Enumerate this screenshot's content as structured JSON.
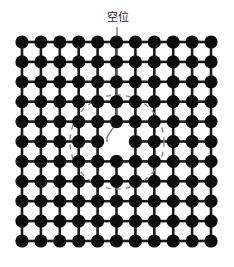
{
  "figure": {
    "caption_label": "空位",
    "background_color": "#ffffff",
    "atom_color": "#0d0d0d",
    "bond_color": "#1a1a1a",
    "annotation_color": "#7a7a7a",
    "dashed_circle_color": "#8a8a8a"
  },
  "chart_data": {
    "type": "scatter",
    "title": "",
    "subtitle": "",
    "xlabel": "",
    "ylabel": "",
    "lattice": {
      "rows": 11,
      "columns": 11,
      "origin_x": 22,
      "origin_y": 42,
      "spacing_x": 18.9,
      "spacing_y": 19.9,
      "atom_radius": 6.6,
      "bond_width": 2.6,
      "total_sites": 121,
      "occupied_sites": 120
    },
    "vacancy": {
      "label": "空位",
      "row_index": 5,
      "col_index": 5,
      "center_x": 117,
      "center_y": 142,
      "present": false
    },
    "annotations": [
      {
        "name": "leader-line",
        "type": "polyline",
        "points": "117,27 117,122 107,137 107,142",
        "color": "#7a7a7a",
        "width": 1.4
      },
      {
        "name": "strain-field-circle",
        "type": "dashed-circle",
        "center_x": 117,
        "center_y": 142,
        "radius": 47,
        "color": "#8a8a8a",
        "width": 1.4,
        "dash": "5 5"
      }
    ],
    "legend": {
      "position": "none",
      "entries": []
    },
    "grid": false,
    "xlim": [
      0,
      234
    ],
    "ylim": [
      0,
      267
    ]
  }
}
